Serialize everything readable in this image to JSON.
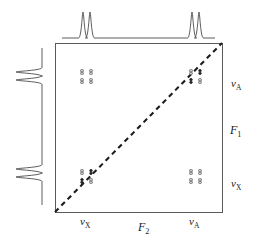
{
  "figure": {
    "caption": ""
  },
  "axes": {
    "f1_label": "F",
    "f1_sub": "1",
    "f2_label": "F",
    "f2_sub": "2",
    "nu_symbol": "ν",
    "sub_A": "A",
    "sub_X": "X",
    "right_ticks": [
      {
        "name": "nu-A-f1",
        "symbol": "ν",
        "sub": "A",
        "x": 231,
        "y": 78
      },
      {
        "name": "nu-X-f1",
        "symbol": "ν",
        "sub": "X",
        "x": 231,
        "y": 178
      }
    ],
    "bottom_ticks": [
      {
        "name": "nu-X-f2",
        "symbol": "ν",
        "sub": "X",
        "x": 80,
        "y": 216
      },
      {
        "name": "nu-A-f2",
        "symbol": "ν",
        "sub": "A",
        "x": 189,
        "y": 216
      }
    ],
    "f1_axis_title": {
      "x": 230,
      "y": 124
    },
    "f2_axis_title": {
      "x": 138,
      "y": 221
    }
  },
  "plot_box": {
    "x": 55,
    "y": 43,
    "width": 167,
    "height": 169,
    "stroke": "#5a5a5a",
    "stroke_width": 1
  },
  "diagonal": {
    "x1": 55,
    "y1": 212,
    "x2": 222,
    "y2": 43,
    "stroke": "#1c1c1c",
    "dash": "5 4",
    "stroke_width": 2.1
  },
  "chart_data": {
    "type": "scatter",
    "xlabel": "F2",
    "ylabel": "F1",
    "xlim": [
      55,
      222
    ],
    "ylim": [
      212,
      43
    ],
    "grid": false,
    "legend": null,
    "axis_tick_labels": {
      "x": [
        "νX",
        "νA"
      ],
      "y": [
        "νA",
        "νX"
      ]
    },
    "annotations": [
      "diagonal peaks lie on dashed diagonal",
      "cross peaks at (νX,νA) and (νA,νX)",
      "each peak is a 2x2 multiplet of four components"
    ],
    "peak_clusters": [
      {
        "name": "cross-peak-top-left",
        "kind": "cross",
        "f2": "νX",
        "f1": "νA",
        "center": {
          "x": 86.5,
          "y": 76.5
        },
        "components": [
          {
            "x": 82,
            "y": 72,
            "filled": false
          },
          {
            "x": 91,
            "y": 72,
            "filled": false
          },
          {
            "x": 82,
            "y": 81,
            "filled": false
          },
          {
            "x": 91,
            "y": 81,
            "filled": false
          }
        ]
      },
      {
        "name": "diagonal-peak-top-right",
        "kind": "diagonal",
        "f2": "νA",
        "f1": "νA",
        "center": {
          "x": 195.5,
          "y": 76.5
        },
        "components": [
          {
            "x": 191,
            "y": 72,
            "filled": false
          },
          {
            "x": 200,
            "y": 72,
            "filled": true
          },
          {
            "x": 191,
            "y": 81,
            "filled": true
          },
          {
            "x": 200,
            "y": 81,
            "filled": false
          }
        ]
      },
      {
        "name": "diagonal-peak-bottom-left",
        "kind": "diagonal",
        "f2": "νX",
        "f1": "νX",
        "center": {
          "x": 86.5,
          "y": 176.5
        },
        "components": [
          {
            "x": 82,
            "y": 172,
            "filled": false
          },
          {
            "x": 91,
            "y": 172,
            "filled": true
          },
          {
            "x": 82,
            "y": 181,
            "filled": true
          },
          {
            "x": 91,
            "y": 181,
            "filled": false
          }
        ]
      },
      {
        "name": "cross-peak-bottom-right",
        "kind": "cross",
        "f2": "νA",
        "f1": "νX",
        "center": {
          "x": 195.5,
          "y": 176.5
        },
        "components": [
          {
            "x": 191,
            "y": 172,
            "filled": false
          },
          {
            "x": 200,
            "y": 172,
            "filled": false
          },
          {
            "x": 191,
            "y": 181,
            "filled": false
          },
          {
            "x": 200,
            "y": 181,
            "filled": false
          }
        ]
      }
    ],
    "top_projection": {
      "name": "f2-projection-trace",
      "baseline_y": 38,
      "peaks": [
        {
          "x": 83,
          "height": 26,
          "label": "νX"
        },
        {
          "x": 90,
          "height": 26,
          "label": "νX"
        },
        {
          "x": 192,
          "height": 26,
          "label": "νA"
        },
        {
          "x": 199,
          "height": 26,
          "label": "νA"
        }
      ],
      "span": [
        62,
        215
      ]
    },
    "left_projection": {
      "name": "f1-projection-trace",
      "baseline_x": 42,
      "peaks": [
        {
          "y": 72,
          "height": 26,
          "label": "νA"
        },
        {
          "y": 80,
          "height": 26,
          "label": "νA"
        },
        {
          "y": 169,
          "height": 26,
          "label": "νX"
        },
        {
          "y": 177,
          "height": 26,
          "label": "νX"
        }
      ],
      "span": [
        48,
        205
      ]
    }
  },
  "colors": {
    "ink": "#1c1c1c",
    "box": "#5a5a5a",
    "trace": "#4a4a4a",
    "peak_open": "#7d7d7d",
    "peak_fill": "#232323",
    "caption": "#8e8e8e"
  }
}
